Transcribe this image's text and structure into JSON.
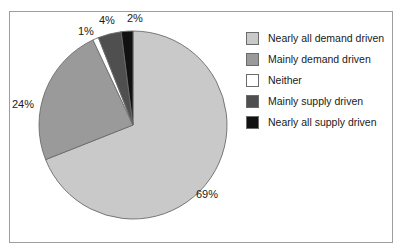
{
  "chart_data": {
    "type": "pie",
    "title": "",
    "xlabel": "",
    "ylabel": "",
    "legend_position": "right",
    "grid": false,
    "start_angle_deg": 0,
    "direction": "clockwise",
    "categories": [
      "Nearly all demand driven",
      "Mainly demand driven",
      "Neither",
      "Mainly supply driven",
      "Nearly all supply driven"
    ],
    "values": [
      69,
      24,
      1,
      4,
      2
    ],
    "value_labels": [
      "69%",
      "24%",
      "1%",
      "4%",
      "2%"
    ],
    "colors": [
      "#c9c9c9",
      "#9a9a9a",
      "#ffffff",
      "#4f4f4f",
      "#111111"
    ],
    "slices": [
      {
        "label": "Nearly all demand driven",
        "value": 69,
        "display": "69%",
        "color": "#c9c9c9"
      },
      {
        "label": "Mainly demand driven",
        "value": 24,
        "display": "24%",
        "color": "#9a9a9a"
      },
      {
        "label": "Neither",
        "value": 1,
        "display": "1%",
        "color": "#ffffff"
      },
      {
        "label": "Mainly supply driven",
        "value": 4,
        "display": "4%",
        "color": "#4f4f4f"
      },
      {
        "label": "Nearly all supply driven",
        "value": 2,
        "display": "2%",
        "color": "#111111"
      }
    ]
  },
  "legend": {
    "items": [
      {
        "label": "Nearly all demand driven",
        "color": "#c9c9c9"
      },
      {
        "label": "Mainly demand driven",
        "color": "#9a9a9a"
      },
      {
        "label": "Neither",
        "color": "#ffffff"
      },
      {
        "label": "Mainly supply driven",
        "color": "#4f4f4f"
      },
      {
        "label": "Nearly all supply driven",
        "color": "#111111"
      }
    ]
  },
  "labels": {
    "pct_69": "69%",
    "pct_24": "24%",
    "pct_1": "1%",
    "pct_4": "4%",
    "pct_2": "2%"
  },
  "frame": {
    "border_color": "#9d9d9d",
    "background": "#ffffff"
  },
  "geometry": {
    "center_x": 133,
    "center_y": 125,
    "radius": 94
  }
}
